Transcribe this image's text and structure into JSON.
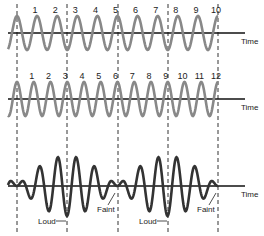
{
  "figure": {
    "waves": [
      {
        "name": "wave-1",
        "cycle_labels": [
          "1",
          "2",
          "3",
          "4",
          "5",
          "6",
          "7",
          "8",
          "9",
          "10"
        ],
        "cycles": 10,
        "axis_label": "Time",
        "color": "#808080"
      },
      {
        "name": "wave-2",
        "cycle_labels": [
          "1",
          "2",
          "3",
          "4",
          "5",
          "6",
          "7",
          "8",
          "9",
          "10",
          "11",
          "12"
        ],
        "cycles": 12,
        "axis_label": "Time",
        "color": "#808080"
      },
      {
        "name": "resultant",
        "axis_label": "Time",
        "color": "#222222",
        "annotations": [
          "Loud",
          "Faint",
          "Loud",
          "Faint"
        ]
      }
    ],
    "dashed_line_xs": [
      17,
      67,
      118,
      168,
      218
    ]
  }
}
